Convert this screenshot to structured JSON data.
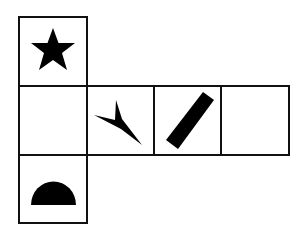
{
  "diagram": {
    "type": "cube-net",
    "line_color": "#111111",
    "fill_color": "#000000",
    "cells": [
      {
        "id": "top",
        "row": 0,
        "col": 0,
        "symbol": "star"
      },
      {
        "id": "middle-left",
        "row": 1,
        "col": 0,
        "symbol": "empty"
      },
      {
        "id": "middle-2",
        "row": 1,
        "col": 1,
        "symbol": "arrowhead"
      },
      {
        "id": "middle-3",
        "row": 1,
        "col": 2,
        "symbol": "diagonal-bar"
      },
      {
        "id": "middle-right",
        "row": 1,
        "col": 3,
        "symbol": "empty"
      },
      {
        "id": "bottom",
        "row": 2,
        "col": 0,
        "symbol": "half-circle"
      }
    ]
  }
}
